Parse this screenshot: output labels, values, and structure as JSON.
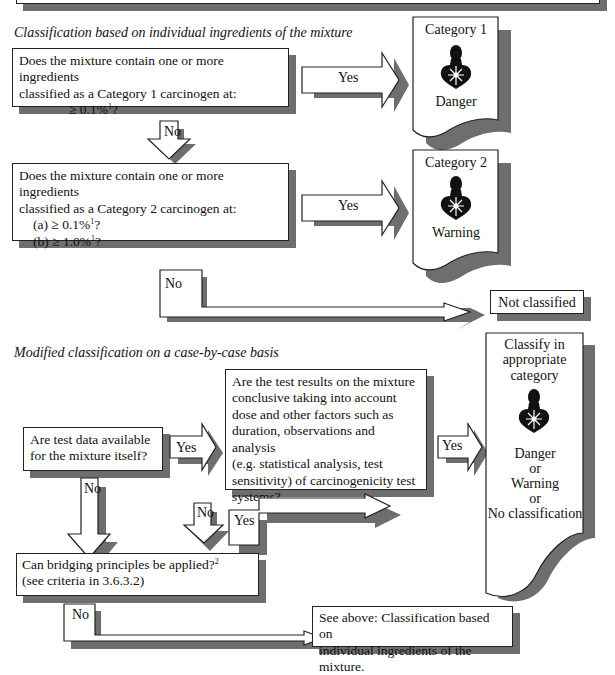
{
  "section1": {
    "title": "Classification based on individual ingredients of the mixture",
    "q1": {
      "line1": "Does the mixture contain one or more ingredients",
      "line2": "classified as a Category 1 carcinogen at:",
      "line3": "≥ 0.1%",
      "line3_sup": "1",
      "line3_end": "?"
    },
    "q1_yes": "Yes",
    "q1_no": "No",
    "result1": {
      "category": "Category 1",
      "signal": "Danger",
      "icon": "health-hazard-icon"
    },
    "q2": {
      "line1": "Does the mixture contain one or more ingredients",
      "line2": "classified as a Category 2 carcinogen at:",
      "line3": "(a) ≥ 0.1%",
      "line3_sup": "1",
      "line3_end": "?",
      "line4": "(b) ≥ 1.0%",
      "line4_sup": "1",
      "line4_end": "?"
    },
    "q2_yes": "Yes",
    "q2_no": "No",
    "result2": {
      "category": "Category 2",
      "signal": "Warning",
      "icon": "health-hazard-icon"
    },
    "not_classified": "Not classified"
  },
  "section2": {
    "title": "Modified classification on a case-by-case basis",
    "q3": {
      "line1": "Are test data available",
      "line2": "for the mixture itself?"
    },
    "q3_yes": "Yes",
    "q3_no": "No",
    "q4": {
      "line1": "Are the test results on the mixture",
      "line2": "conclusive taking into account",
      "line3": "dose and other factors such as",
      "line4": "duration, observations and analysis",
      "line5": "(e.g. statistical analysis, test",
      "line6": "sensitivity) of carcinogenicity test",
      "line7": "systems?"
    },
    "q4_yes": "Yes",
    "q4_no": "No",
    "q5_yes": "Yes",
    "result3": {
      "line1": "Classify in",
      "line2": "appropriate",
      "line3": "category",
      "signal1": "Danger",
      "or1": "or",
      "signal2": "Warning",
      "or2": "or",
      "signal3": "No classification",
      "icon": "health-hazard-icon"
    },
    "q5": {
      "line1": "Can bridging principles be applied?",
      "line1_sup": "2",
      "line2": "(see criteria in 3.6.3.2)"
    },
    "q5_no": "No",
    "see_above": {
      "line1": "See above: Classification based on",
      "line2": "individual ingredients of the mixture."
    }
  }
}
